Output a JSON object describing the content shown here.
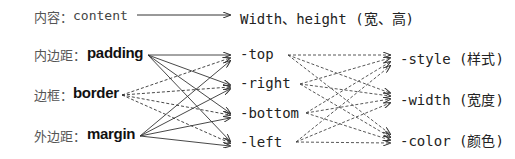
{
  "content_row": {
    "label_cn": "内容：",
    "label_en": "content",
    "target": "Width、height (宽、高)"
  },
  "sources": [
    {
      "cn": "内边距：",
      "en": "padding"
    },
    {
      "cn": "边框：",
      "en": "border"
    },
    {
      "cn": "外边距：",
      "en": "margin"
    }
  ],
  "sides": [
    "-top",
    "-right",
    "-bottom",
    "-left"
  ],
  "properties": [
    "-style (样式)",
    "-width (宽度)",
    "-color (颜色)"
  ],
  "colors": {
    "line": "#333333",
    "text": "#222222"
  }
}
